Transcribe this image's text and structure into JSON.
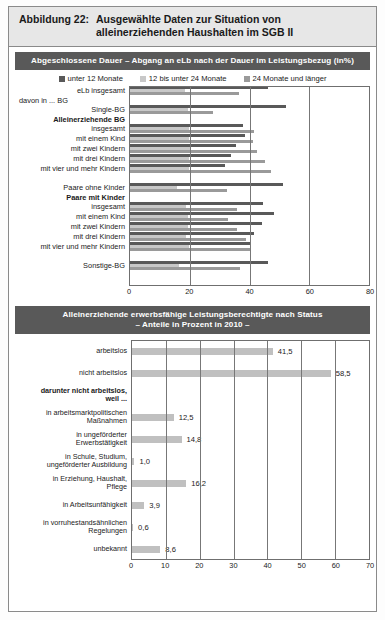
{
  "figure": {
    "label": "Abbildung 22:",
    "title_line1": "Ausgewählte Daten zur Situation von",
    "title_line2": "alleinerziehenden Haushalten im SGB II"
  },
  "colors": {
    "header_bg": "#595959",
    "title_bg": "#e7e7e7",
    "series_dark": "#595959",
    "series_light": "#c8c8c8",
    "series_mid": "#9a9a9a",
    "bar_gray": "#c0c0c0",
    "frame": "#8a8a8a"
  },
  "panel1": {
    "heading": "Abgeschlossene Dauer – Abgang an eLb nach der Dauer im Leistungsbezug (in%)",
    "legend": [
      {
        "label": "unter 12 Monate",
        "color": "#595959"
      },
      {
        "label": "12 bis unter 24 Monate",
        "color": "#c8c8c8"
      },
      {
        "label": "24 Monate und länger",
        "color": "#9a9a9a"
      }
    ]
  },
  "panel2": {
    "heading_line1": "Alleinerziehende erwerbsfähige Leistungsberechtigte nach Status",
    "heading_line2": "– Anteile in Prozent in 2010 –"
  },
  "chart_data": [
    {
      "type": "bar",
      "orientation": "horizontal",
      "title": "Abgeschlossene Dauer – Abgang an eLb nach der Dauer im Leistungsbezug (in%)",
      "xlabel": "",
      "ylabel": "",
      "xlim": [
        0,
        80
      ],
      "xticks": [
        0,
        20,
        40,
        60,
        80
      ],
      "grid": true,
      "legend_position": "top",
      "categories": [
        "eLb insgesamt",
        "davon in ... BG",
        "Single-BG",
        "Alleinerziehende BG",
        "insgesamt",
        "mit einem Kind",
        "mit zwei Kindern",
        "mit drei Kindern",
        "mit vier und mehr Kindern",
        "",
        "Paare ohne Kinder",
        "Paare mit Kinder",
        "insgesamt",
        "mit einem Kind",
        "mit zwei Kindern",
        "mit drei Kindern",
        "mit vier und mehr Kindern",
        "",
        "Sonstige-BG"
      ],
      "bold_categories": [
        "Alleinerziehende BG",
        "Paare mit Kinder"
      ],
      "header_categories": [
        "davon in ... BG"
      ],
      "series": [
        {
          "name": "unter 12 Monate",
          "color": "#595959",
          "values": [
            46.0,
            null,
            52.0,
            null,
            38.0,
            38.5,
            35.5,
            34.0,
            32.0,
            null,
            51.0,
            null,
            44.5,
            48.0,
            44.0,
            41.5,
            40.5,
            null,
            46.0
          ]
        },
        {
          "name": "12 bis unter 24 Monate",
          "color": "#c8c8c8",
          "values": [
            18.5,
            null,
            19.5,
            null,
            20.0,
            20.0,
            20.5,
            20.0,
            20.0,
            null,
            16.0,
            null,
            19.0,
            19.5,
            19.5,
            19.0,
            20.0,
            null,
            16.5
          ]
        },
        {
          "name": "24 Monate und länger",
          "color": "#9a9a9a",
          "values": [
            36.5,
            null,
            28.0,
            null,
            41.5,
            41.0,
            42.5,
            45.0,
            47.0,
            null,
            32.5,
            null,
            36.0,
            33.0,
            36.0,
            39.0,
            40.0,
            null,
            37.0
          ]
        }
      ]
    },
    {
      "type": "bar",
      "orientation": "horizontal",
      "title": "Alleinerziehende erwerbsfähige Leistungsberechtigte nach Status – Anteile in Prozent in 2010 –",
      "xlabel": "",
      "ylabel": "",
      "xlim": [
        0,
        70
      ],
      "xticks": [
        0,
        10,
        20,
        30,
        40,
        50,
        60,
        70
      ],
      "grid": true,
      "color": "#c0c0c0",
      "categories": [
        "arbeitslos",
        "nicht arbeitslos",
        "darunter nicht arbeitslos, weil ...",
        "in arbeitsmarktpolitischen Maßnahmen",
        "in ungeförderter Erwerbstätigkeit",
        "in Schule, Studium, ungeförderter Ausbildung",
        "in Erziehung, Haushalt, Pflege",
        "in Arbeitsunfähigkeit",
        "in vorruhestandsähnlichen Regelungen",
        "unbekannt"
      ],
      "values": [
        41.5,
        58.5,
        null,
        12.5,
        14.8,
        1.0,
        16.2,
        3.9,
        0.6,
        8.6
      ],
      "value_labels": [
        "41,5",
        "58,5",
        "",
        "12,5",
        "14,8",
        "1,0",
        "16,2",
        "3,9",
        "0,6",
        "8,6"
      ],
      "bold_categories": [
        "darunter nicht arbeitslos, weil ..."
      ]
    }
  ],
  "rows1": [
    {
      "label": "eLb insgesamt",
      "bold": false,
      "spacer": false,
      "bars": [
        46.0,
        18.5,
        36.5
      ]
    },
    {
      "label": "davon in ... BG",
      "bold": false,
      "spacer": true,
      "align": "left",
      "bars": null
    },
    {
      "label": "Single-BG",
      "bold": false,
      "spacer": false,
      "bars": [
        52.0,
        19.5,
        28.0
      ]
    },
    {
      "label": "Alleinerziehende BG",
      "bold": true,
      "spacer": true,
      "bars": null
    },
    {
      "label": "insgesamt",
      "bold": false,
      "spacer": false,
      "bars": [
        38.0,
        20.0,
        41.5
      ]
    },
    {
      "label": "mit einem Kind",
      "bold": false,
      "spacer": false,
      "bars": [
        38.5,
        20.0,
        41.0
      ]
    },
    {
      "label": "mit zwei Kindern",
      "bold": false,
      "spacer": false,
      "bars": [
        35.5,
        20.5,
        42.5
      ]
    },
    {
      "label": "mit drei Kindern",
      "bold": false,
      "spacer": false,
      "bars": [
        34.0,
        20.0,
        45.0
      ]
    },
    {
      "label": "mit vier und mehr Kindern",
      "bold": false,
      "spacer": false,
      "bars": [
        32.0,
        20.0,
        47.0
      ]
    },
    {
      "label": "",
      "bold": false,
      "spacer": true,
      "bars": null
    },
    {
      "label": "Paare ohne Kinder",
      "bold": false,
      "spacer": false,
      "bars": [
        51.0,
        16.0,
        32.5
      ]
    },
    {
      "label": "Paare mit Kinder",
      "bold": true,
      "spacer": true,
      "bars": null
    },
    {
      "label": "insgesamt",
      "bold": false,
      "spacer": false,
      "bars": [
        44.5,
        19.0,
        36.0
      ]
    },
    {
      "label": "mit einem Kind",
      "bold": false,
      "spacer": false,
      "bars": [
        48.0,
        19.5,
        33.0
      ]
    },
    {
      "label": "mit zwei Kindern",
      "bold": false,
      "spacer": false,
      "bars": [
        44.0,
        19.5,
        36.0
      ]
    },
    {
      "label": "mit drei Kindern",
      "bold": false,
      "spacer": false,
      "bars": [
        41.5,
        19.0,
        39.0
      ]
    },
    {
      "label": "mit vier und mehr Kindern",
      "bold": false,
      "spacer": false,
      "bars": [
        40.5,
        20.0,
        40.0
      ]
    },
    {
      "label": "",
      "bold": false,
      "spacer": true,
      "bars": null
    },
    {
      "label": "Sonstige-BG",
      "bold": false,
      "spacer": false,
      "bars": [
        46.0,
        16.5,
        37.0
      ]
    }
  ],
  "axis1": {
    "ticks": [
      "0",
      "20",
      "40",
      "60",
      "80"
    ],
    "max": 80
  },
  "rows2": [
    {
      "label": "arbeitslos",
      "bold": false,
      "value": 41.5,
      "vlabel": "41,5"
    },
    {
      "label": "nicht arbeitslos",
      "bold": false,
      "value": 58.5,
      "vlabel": "58,5"
    },
    {
      "label": "darunter nicht arbeitslos,\nweil ...",
      "bold": true,
      "value": null,
      "vlabel": ""
    },
    {
      "label": "in arbeitsmarktpolitischen\nMaßnahmen",
      "bold": false,
      "value": 12.5,
      "vlabel": "12,5"
    },
    {
      "label": "in ungeförderter\nErwerbstätigkeit",
      "bold": false,
      "value": 14.8,
      "vlabel": "14,8"
    },
    {
      "label": "in Schule, Studium,\nungeförderter Ausbildung",
      "bold": false,
      "value": 1.0,
      "vlabel": "1,0"
    },
    {
      "label": "in Erziehung, Haushalt,\nPflege",
      "bold": false,
      "value": 16.2,
      "vlabel": "16,2"
    },
    {
      "label": "in Arbeitsunfähigkeit",
      "bold": false,
      "value": 3.9,
      "vlabel": "3,9"
    },
    {
      "label": "in vorruhestandsähnlichen\nRegelungen",
      "bold": false,
      "value": 0.6,
      "vlabel": "0,6"
    },
    {
      "label": "unbekannt",
      "bold": false,
      "value": 8.6,
      "vlabel": "8,6"
    }
  ],
  "axis2": {
    "ticks": [
      "0",
      "10",
      "20",
      "30",
      "40",
      "50",
      "60",
      "70"
    ],
    "max": 70
  }
}
